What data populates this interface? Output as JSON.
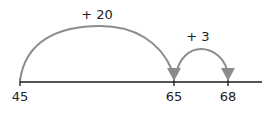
{
  "number_line": {
    "start_label": "45",
    "ticks": [
      {
        "value": "45",
        "x": 20
      },
      {
        "value": "65",
        "x": 174
      },
      {
        "value": "68",
        "x": 228
      }
    ]
  },
  "jumps": [
    {
      "label": "+ 20",
      "from": "45",
      "to": "65"
    },
    {
      "label": "+ 3",
      "from": "65",
      "to": "68"
    }
  ],
  "colors": {
    "arc": "#8c8c8c",
    "line": "#1a1a1a"
  }
}
